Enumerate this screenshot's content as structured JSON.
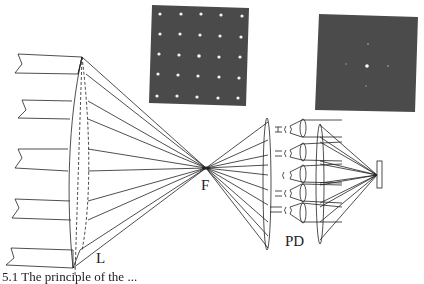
{
  "figure": {
    "caption": "5.1  The principle of the ...",
    "labels": {
      "lens": "L",
      "focus": "F",
      "detector": "PD"
    },
    "insets": [
      {
        "name": "spot-array-image",
        "description": "5x5 grid of bright spots on dark background"
      },
      {
        "name": "single-spot-image",
        "description": "central bright spot with faint side spots on dark background"
      }
    ],
    "colors": {
      "line": "#222222",
      "inset_bg": "#4a4a4a",
      "spot": "#f2f2f2"
    }
  }
}
